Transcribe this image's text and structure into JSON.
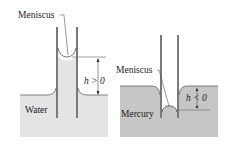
{
  "diagram": {
    "panels": [
      {
        "id": "water",
        "liquid_label": "Water",
        "meniscus_label": "Meniscus",
        "height_label": "h > 0",
        "fill_color": "#e4e4e4"
      },
      {
        "id": "mercury",
        "liquid_label": "Mercury",
        "meniscus_label": "Meniscus",
        "height_label": "h < 0",
        "fill_color": "#c6c6c6"
      }
    ],
    "colors": {
      "tube": "#333333",
      "line": "#555555",
      "text": "#222222"
    }
  }
}
